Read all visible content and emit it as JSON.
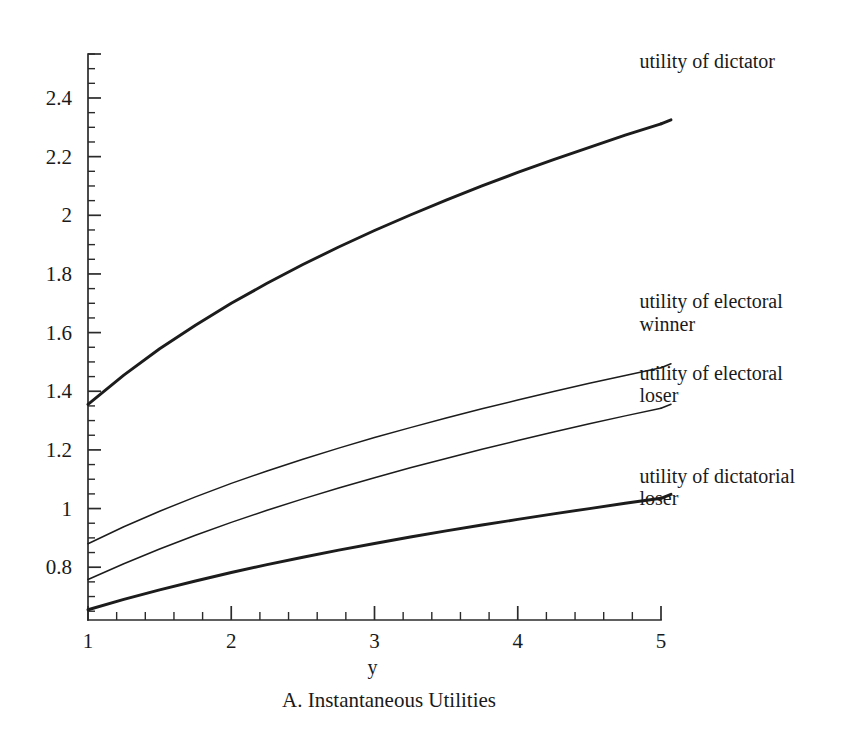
{
  "figure": {
    "caption": "A. Instantaneous Utilities"
  },
  "chart_data": {
    "type": "line",
    "title": "",
    "caption": "A. Instantaneous Utilities",
    "xlabel": "y",
    "ylabel": "",
    "xlim": [
      1,
      5
    ],
    "ylim": [
      0.62,
      2.55
    ],
    "grid": false,
    "legend_position": "right-inline-labels",
    "x_ticks_major": [
      1,
      2,
      3,
      4,
      5
    ],
    "x_tick_labels": [
      "1",
      "2",
      "3",
      "4",
      "5"
    ],
    "x_minor_tick_step": 0.2,
    "y_ticks_major": [
      0.8,
      1,
      1.2,
      1.4,
      1.6,
      1.8,
      2,
      2.2,
      2.4
    ],
    "y_tick_labels": [
      "0.8",
      "1",
      "1.2",
      "1.4",
      "1.6",
      "1.8",
      "2",
      "2.2",
      "2.4"
    ],
    "y_minor_tick_step": 0.05,
    "x": [
      1,
      1.25,
      1.5,
      1.75,
      2,
      2.25,
      2.5,
      2.75,
      3,
      3.25,
      3.5,
      3.75,
      4,
      4.25,
      4.5,
      4.75,
      5
    ],
    "series": [
      {
        "name": "utility of dictator",
        "label": "utility of dictator",
        "linewidth": "thick",
        "color": "#1c1c1c",
        "label_x": 4.85,
        "label_y": 2.52,
        "values": [
          1.355,
          1.455,
          1.545,
          1.625,
          1.7,
          1.768,
          1.832,
          1.892,
          1.948,
          2.001,
          2.052,
          2.1,
          2.146,
          2.19,
          2.232,
          2.273,
          2.312
        ]
      },
      {
        "name": "utility of electoral winner",
        "label": "utility of electoral\nwinner",
        "linewidth": "thin",
        "color": "#1c1c1c",
        "label_x": 4.85,
        "label_y": 1.7,
        "values": [
          0.88,
          0.938,
          0.991,
          1.04,
          1.086,
          1.128,
          1.168,
          1.206,
          1.242,
          1.276,
          1.309,
          1.34,
          1.37,
          1.399,
          1.427,
          1.454,
          1.48
        ]
      },
      {
        "name": "utility of electoral loser",
        "label": "utility of electoral\nloser",
        "linewidth": "thin",
        "color": "#1c1c1c",
        "label_x": 4.85,
        "label_y": 1.455,
        "values": [
          0.758,
          0.812,
          0.862,
          0.909,
          0.953,
          0.994,
          1.033,
          1.07,
          1.105,
          1.139,
          1.171,
          1.202,
          1.232,
          1.261,
          1.289,
          1.316,
          1.342
        ]
      },
      {
        "name": "utility of dictatorial loser",
        "label": "utility of dictatorial\nloser",
        "linewidth": "thick",
        "color": "#1c1c1c",
        "label_x": 4.85,
        "label_y": 1.105,
        "values": [
          0.655,
          0.69,
          0.723,
          0.753,
          0.782,
          0.809,
          0.834,
          0.858,
          0.881,
          0.903,
          0.924,
          0.944,
          0.963,
          0.982,
          1.0,
          1.018,
          1.035
        ]
      }
    ]
  }
}
